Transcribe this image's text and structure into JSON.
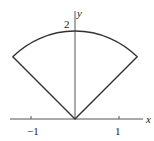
{
  "figure": {
    "axes": {
      "x_label": "x",
      "y_label": "y",
      "x_ticks": [
        {
          "value": -1,
          "label": "−1"
        },
        {
          "value": 1,
          "label": "1"
        }
      ],
      "y_ticks": [
        {
          "value": 2,
          "label": "2"
        }
      ]
    },
    "sector": {
      "radius": 2,
      "start_angle_deg": 45,
      "end_angle_deg": 135
    },
    "colors": {
      "stroke": "#333333",
      "axis": "#555555",
      "background": "#ffffff"
    }
  }
}
